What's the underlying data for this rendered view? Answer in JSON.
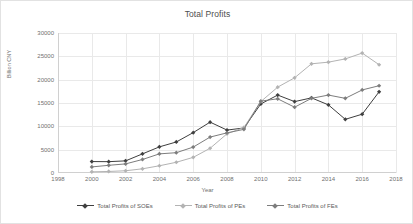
{
  "chart_data": {
    "type": "line",
    "title": "Total Profits",
    "xlabel": "Year",
    "ylabel": "Billion CNY",
    "xlim": [
      1998,
      2018
    ],
    "ylim": [
      0,
      30000
    ],
    "xticks": [
      1998,
      2000,
      2002,
      2004,
      2006,
      2008,
      2010,
      2012,
      2014,
      2016,
      2018
    ],
    "yticks": [
      0,
      5000,
      10000,
      15000,
      20000,
      25000,
      30000
    ],
    "grid": true,
    "legend_position": "bottom",
    "x": [
      2000,
      2001,
      2002,
      2003,
      2004,
      2005,
      2006,
      2007,
      2008,
      2009,
      2010,
      2011,
      2012,
      2013,
      2014,
      2015,
      2016,
      2017
    ],
    "series": [
      {
        "name": "Total Profits of SOEs",
        "color": "#3f3f3f",
        "marker": "diamond",
        "values": [
          2450,
          2430,
          2600,
          4100,
          5600,
          6650,
          8650,
          10900,
          9200,
          9650,
          14800,
          16700,
          15300,
          16100,
          14600,
          11500,
          12600,
          17400
        ]
      },
      {
        "name": "Total Profits of PEs",
        "color": "#b3b3b3",
        "marker": "diamond",
        "values": [
          250,
          330,
          480,
          900,
          1550,
          2300,
          3350,
          5300,
          8400,
          9750,
          15300,
          18400,
          20400,
          23400,
          23750,
          24450,
          25700,
          23200
        ]
      },
      {
        "name": "Total Profits of FEs",
        "color": "#7d7d7d",
        "marker": "diamond",
        "values": [
          1300,
          1650,
          1950,
          2900,
          4100,
          4350,
          5550,
          7700,
          8600,
          9350,
          15400,
          15900,
          14100,
          16000,
          16700,
          16000,
          17800,
          18700
        ]
      }
    ]
  }
}
